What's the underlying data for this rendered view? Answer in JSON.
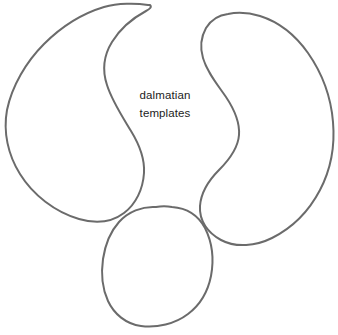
{
  "canvas": {
    "width": 338,
    "height": 335,
    "background_color": "#ffffff",
    "title": "dalmatian templates"
  },
  "style": {
    "outline_stroke_color": "#6b6b6b",
    "outline_fill_color": "#ffffff",
    "outline_stroke_width": 2,
    "text_color": "#1c1c1c"
  },
  "caption": {
    "line1": "dalmatian",
    "line2": "templates",
    "full_text": "dalmatian templates"
  },
  "shapes": [
    {
      "name": "left-spot-shape",
      "description": "large crescent / comma shaped dalmatian spot outline on the left, hooked point at top right",
      "bounds": {
        "x": 5,
        "y": 3,
        "width": 145,
        "height": 222
      }
    },
    {
      "name": "right-spot-shape",
      "description": "large kidney / bean shaped dalmatian spot outline on the right with concave left edge",
      "bounds": {
        "x": 199,
        "y": 13,
        "width": 135,
        "height": 232
      }
    },
    {
      "name": "bottom-spot-shape",
      "description": "small rounded egg shaped dalmatian spot outline at bottom center",
      "bounds": {
        "x": 101,
        "y": 206,
        "width": 112,
        "height": 121
      }
    }
  ]
}
